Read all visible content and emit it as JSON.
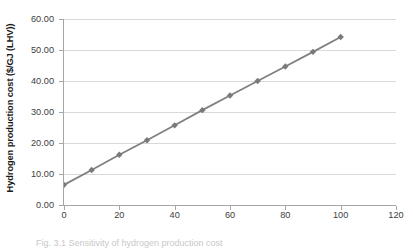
{
  "figure": {
    "caption": "Fig. 3.1  Sensitivity of hydrogen production cost"
  },
  "chart_data": {
    "type": "line",
    "title": "",
    "xlabel": "",
    "ylabel": "Hydrogen production cost ($/GJ (LHV))",
    "x": [
      0,
      10,
      20,
      30,
      40,
      50,
      60,
      70,
      80,
      90,
      100
    ],
    "values": [
      6.5,
      11.3,
      16.2,
      20.9,
      25.7,
      30.6,
      35.3,
      40.0,
      44.7,
      49.4,
      54.2
    ],
    "series": [
      {
        "name": "Hydrogen production cost",
        "values": [
          6.5,
          11.3,
          16.2,
          20.9,
          25.7,
          30.6,
          35.3,
          40.0,
          44.7,
          49.4,
          54.2
        ]
      }
    ],
    "xlim": [
      0,
      120
    ],
    "ylim": [
      0,
      60
    ],
    "xticks": [
      0,
      20,
      40,
      60,
      80,
      100,
      120
    ],
    "xtick_labels": [
      "0",
      "20",
      "40",
      "60",
      "80",
      "100",
      "120"
    ],
    "yticks": [
      0,
      10,
      20,
      30,
      40,
      50,
      60
    ],
    "ytick_labels": [
      "0.00",
      "10.00",
      "20.00",
      "30.00",
      "40.00",
      "50.00",
      "60.00"
    ],
    "grid": "horizontal",
    "legend": "none",
    "marker": "diamond",
    "line_color": "#808080",
    "marker_color": "#7a7a7a",
    "grid_color": "#d9d9d9",
    "axis_color": "#a6a6a6"
  }
}
